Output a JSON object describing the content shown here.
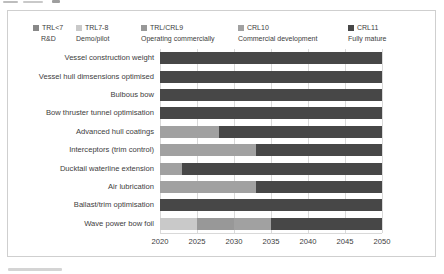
{
  "chart_data": {
    "type": "bar",
    "variant": "horizontal-stacked-timeline",
    "title": "",
    "x_axis": {
      "label": "",
      "min": 2020,
      "max": 2050,
      "ticks": [
        2020,
        2025,
        2030,
        2035,
        2040,
        2045,
        2050
      ],
      "tick_labels": [
        "2020",
        "2025",
        "2030",
        "2035",
        "2040",
        "2045",
        "2050"
      ],
      "grid": true
    },
    "legend_position": "top",
    "series_colors": {
      "TRL<7": "#888888",
      "TRL7-8": "#c9c9c9",
      "TRL/CRL9": "#989898",
      "CRL10": "#a1a1a1",
      "CRL11": "#474747"
    },
    "legend": [
      {
        "series": "TRL<7",
        "label": "TRL<7",
        "sublabel": "R&D",
        "color": "#888888"
      },
      {
        "series": "TRL7-8",
        "label": "TRL7-8",
        "sublabel": "Demo/pilot",
        "color": "#c9c9c9"
      },
      {
        "series": "TRL/CRL9",
        "label": "TRL/CRL9",
        "sublabel": "Operating commercially",
        "color": "#989898"
      },
      {
        "series": "CRL10",
        "label": "CRL10",
        "sublabel": "Commercial development",
        "color": "#a1a1a1"
      },
      {
        "series": "CRL11",
        "label": "CRL11",
        "sublabel": "Fully mature",
        "color": "#474747"
      }
    ],
    "rows": [
      {
        "label": "Vessel construction weight",
        "segments": [
          {
            "series": "CRL11",
            "start": 2020,
            "end": 2050
          }
        ]
      },
      {
        "label": "Vessel hull dimsensions optimised",
        "segments": [
          {
            "series": "CRL11",
            "start": 2020,
            "end": 2050
          }
        ]
      },
      {
        "label": "Bulbous bow",
        "segments": [
          {
            "series": "CRL11",
            "start": 2020,
            "end": 2050
          }
        ]
      },
      {
        "label": "Bow thruster tunnel optimisation",
        "segments": [
          {
            "series": "CRL11",
            "start": 2020,
            "end": 2050
          }
        ]
      },
      {
        "label": "Advanced hull coatings",
        "segments": [
          {
            "series": "CRL10",
            "start": 2020,
            "end": 2028
          },
          {
            "series": "CRL11",
            "start": 2028,
            "end": 2050
          }
        ]
      },
      {
        "label": "Interceptors (trim control)",
        "segments": [
          {
            "series": "CRL10",
            "start": 2020,
            "end": 2033
          },
          {
            "series": "CRL11",
            "start": 2033,
            "end": 2050
          }
        ]
      },
      {
        "label": "Ducktail waterline extension",
        "segments": [
          {
            "series": "CRL10",
            "start": 2020,
            "end": 2023
          },
          {
            "series": "CRL11",
            "start": 2023,
            "end": 2050
          }
        ]
      },
      {
        "label": "Air lubrication",
        "segments": [
          {
            "series": "CRL10",
            "start": 2020,
            "end": 2033
          },
          {
            "series": "CRL11",
            "start": 2033,
            "end": 2050
          }
        ]
      },
      {
        "label": "Ballast/trim optimisation",
        "segments": [
          {
            "series": "CRL11",
            "start": 2020,
            "end": 2050
          }
        ]
      },
      {
        "label": "Wave power bow foil",
        "segments": [
          {
            "series": "TRL7-8",
            "start": 2020,
            "end": 2025
          },
          {
            "series": "TRL/CRL9",
            "start": 2025,
            "end": 2030
          },
          {
            "series": "CRL10",
            "start": 2030,
            "end": 2035
          },
          {
            "series": "CRL11",
            "start": 2035,
            "end": 2050
          }
        ]
      }
    ]
  }
}
